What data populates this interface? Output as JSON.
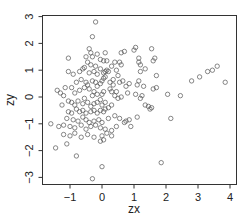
{
  "chart_data": {
    "type": "scatter",
    "title": "",
    "xlabel": "zx",
    "ylabel": "zy",
    "xlim": [
      -1.75,
      4.15
    ],
    "ylim": [
      -3.1,
      3.1
    ],
    "x_ticks": [
      -1,
      0,
      1,
      2,
      3,
      4
    ],
    "y_ticks": [
      -3,
      -2,
      -1,
      0,
      1,
      2,
      3
    ],
    "grid": false,
    "legend": null,
    "marker": "open-circle",
    "marker_color": "#555555",
    "points": [
      [
        -0.2,
        2.8
      ],
      [
        -0.3,
        2.25
      ],
      [
        -0.4,
        1.8
      ],
      [
        -0.35,
        1.65
      ],
      [
        -0.5,
        1.5
      ],
      [
        -0.3,
        1.5
      ],
      [
        -0.45,
        1.3
      ],
      [
        -0.35,
        1.2
      ],
      [
        -0.15,
        1.6
      ],
      [
        0.1,
        1.65
      ],
      [
        -0.05,
        1.4
      ],
      [
        0.05,
        1.35
      ],
      [
        0.15,
        1.35
      ],
      [
        -1.05,
        1.45
      ],
      [
        -1.05,
        0.95
      ],
      [
        -0.7,
        0.95
      ],
      [
        -0.9,
        0.85
      ],
      [
        -0.55,
        1.1
      ],
      [
        -0.6,
        1.05
      ],
      [
        -0.4,
        0.9
      ],
      [
        -0.25,
        0.95
      ],
      [
        -0.15,
        0.85
      ],
      [
        0.05,
        0.9
      ],
      [
        0.1,
        0.95
      ],
      [
        0.15,
        1.0
      ],
      [
        0.2,
        0.95
      ],
      [
        0.45,
        1.0
      ],
      [
        0.6,
        1.65
      ],
      [
        0.7,
        1.7
      ],
      [
        0.55,
        1.3
      ],
      [
        0.6,
        1.2
      ],
      [
        0.5,
        0.8
      ],
      [
        0.55,
        0.55
      ],
      [
        1.0,
        1.75
      ],
      [
        1.05,
        1.85
      ],
      [
        1.55,
        1.8
      ],
      [
        1.15,
        1.45
      ],
      [
        1.15,
        1.3
      ],
      [
        1.2,
        1.2
      ],
      [
        1.6,
        1.35
      ],
      [
        1.65,
        1.45
      ],
      [
        1.35,
        1.05
      ],
      [
        1.2,
        0.95
      ],
      [
        1.7,
        0.8
      ],
      [
        1.15,
        0.6
      ],
      [
        1.1,
        0.45
      ],
      [
        1.3,
        0.4
      ],
      [
        1.6,
        0.3
      ],
      [
        1.7,
        0.35
      ],
      [
        1.05,
        0.1
      ],
      [
        1.2,
        -0.05
      ],
      [
        1.25,
        0.05
      ],
      [
        1.45,
        -0.35
      ],
      [
        1.5,
        -0.45
      ],
      [
        1.55,
        -0.4
      ],
      [
        1.35,
        -0.3
      ],
      [
        2.05,
        0.1
      ],
      [
        2.45,
        0.05
      ],
      [
        2.8,
        0.6
      ],
      [
        3.05,
        0.75
      ],
      [
        3.3,
        0.95
      ],
      [
        3.45,
        1.0
      ],
      [
        3.6,
        1.15
      ],
      [
        3.85,
        0.55
      ],
      [
        2.15,
        -0.8
      ],
      [
        1.85,
        -2.45
      ],
      [
        1.1,
        -0.75
      ],
      [
        0.85,
        -0.85
      ],
      [
        0.75,
        -0.9
      ],
      [
        0.7,
        -0.95
      ],
      [
        0.9,
        -1.1
      ],
      [
        -0.95,
        0.35
      ],
      [
        -0.7,
        0.25
      ],
      [
        -0.85,
        0.15
      ],
      [
        -0.5,
        0.55
      ],
      [
        -0.45,
        0.45
      ],
      [
        -0.55,
        0.35
      ],
      [
        -0.4,
        0.3
      ],
      [
        -0.3,
        0.6
      ],
      [
        -0.2,
        0.55
      ],
      [
        -0.15,
        0.4
      ],
      [
        -0.05,
        0.5
      ],
      [
        0.0,
        0.6
      ],
      [
        0.05,
        0.7
      ],
      [
        0.1,
        0.75
      ],
      [
        -0.25,
        0.2
      ],
      [
        -0.3,
        0.05
      ],
      [
        -0.15,
        0.1
      ],
      [
        0.0,
        0.1
      ],
      [
        0.05,
        0.2
      ],
      [
        0.25,
        0.3
      ],
      [
        0.3,
        0.2
      ],
      [
        0.35,
        0.45
      ],
      [
        0.4,
        0.05
      ],
      [
        0.5,
        -0.05
      ],
      [
        0.45,
        0.2
      ],
      [
        0.6,
        0.0
      ],
      [
        0.75,
        0.4
      ],
      [
        0.85,
        0.5
      ],
      [
        -1.4,
        0.25
      ],
      [
        -1.3,
        0.15
      ],
      [
        -1.2,
        0.05
      ],
      [
        -1.15,
        0.35
      ],
      [
        -0.95,
        -0.2
      ],
      [
        -0.85,
        -0.3
      ],
      [
        -0.75,
        -0.15
      ],
      [
        -0.6,
        -0.25
      ],
      [
        -0.55,
        -0.05
      ],
      [
        -0.45,
        -0.2
      ],
      [
        -0.35,
        -0.35
      ],
      [
        -0.25,
        -0.25
      ],
      [
        -0.15,
        -0.2
      ],
      [
        -0.05,
        -0.1
      ],
      [
        0.0,
        -0.3
      ],
      [
        0.1,
        -0.2
      ],
      [
        0.2,
        -0.4
      ],
      [
        0.3,
        -0.3
      ],
      [
        -1.05,
        -0.55
      ],
      [
        -0.95,
        -0.6
      ],
      [
        -0.8,
        -0.45
      ],
      [
        -0.7,
        -0.55
      ],
      [
        -0.6,
        -0.5
      ],
      [
        -0.5,
        -0.6
      ],
      [
        -0.35,
        -0.55
      ],
      [
        -0.25,
        -0.5
      ],
      [
        -0.15,
        -0.6
      ],
      [
        -0.05,
        -0.5
      ],
      [
        0.05,
        -0.55
      ],
      [
        0.1,
        -0.45
      ],
      [
        -1.1,
        -0.8
      ],
      [
        -0.9,
        -0.85
      ],
      [
        -0.75,
        -0.9
      ],
      [
        -0.6,
        -0.75
      ],
      [
        -0.5,
        -0.85
      ],
      [
        -0.4,
        -0.95
      ],
      [
        -0.25,
        -0.9
      ],
      [
        -0.1,
        -0.85
      ],
      [
        0.0,
        -0.95
      ],
      [
        0.2,
        -0.8
      ],
      [
        0.4,
        -0.7
      ],
      [
        0.55,
        -0.8
      ],
      [
        -1.35,
        -1.1
      ],
      [
        -1.2,
        -1.05
      ],
      [
        -1.0,
        -1.1
      ],
      [
        -0.85,
        -1.15
      ],
      [
        -0.65,
        -1.05
      ],
      [
        -0.5,
        -1.2
      ],
      [
        -0.35,
        -1.1
      ],
      [
        -0.2,
        -1.05
      ],
      [
        -0.05,
        -1.15
      ],
      [
        0.1,
        -1.2
      ],
      [
        0.3,
        -1.25
      ],
      [
        0.45,
        -1.1
      ],
      [
        -1.2,
        -1.4
      ],
      [
        -1.0,
        -1.45
      ],
      [
        -0.85,
        -1.35
      ],
      [
        -0.65,
        -1.5
      ],
      [
        -0.45,
        -1.4
      ],
      [
        -0.25,
        -1.5
      ],
      [
        0.0,
        -1.45
      ],
      [
        0.15,
        -1.35
      ],
      [
        0.3,
        -1.45
      ],
      [
        -0.05,
        -1.65
      ],
      [
        0.05,
        -1.6
      ],
      [
        -1.6,
        -1.0
      ],
      [
        -1.45,
        -1.9
      ],
      [
        -1.1,
        -1.75
      ],
      [
        -0.8,
        -2.2
      ],
      [
        0.0,
        -2.6
      ],
      [
        -0.3,
        -3.05
      ],
      [
        -1.25,
        -0.3
      ],
      [
        -1.05,
        -0.15
      ],
      [
        -0.2,
        1.15
      ],
      [
        -0.05,
        1.05
      ],
      [
        0.3,
        1.15
      ],
      [
        0.4,
        1.3
      ],
      [
        -0.8,
        0.55
      ],
      [
        -0.65,
        0.65
      ],
      [
        0.25,
        0.55
      ],
      [
        0.35,
        0.65
      ],
      [
        0.65,
        0.6
      ],
      [
        0.8,
        0.15
      ]
    ]
  }
}
